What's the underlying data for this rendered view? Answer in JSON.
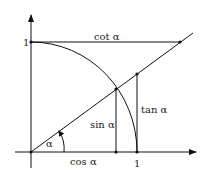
{
  "diagram": {
    "labels": {
      "y_one": "1",
      "x_one": "1",
      "cot": "cot α",
      "tan": "tan α",
      "sin": "sin α",
      "cos": "cos α",
      "angle": "α"
    },
    "colors": {
      "stroke": "#111111",
      "background": "#ffffff"
    }
  }
}
